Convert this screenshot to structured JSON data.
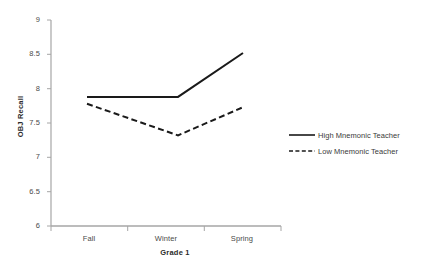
{
  "chart_data": {
    "type": "line",
    "title": "",
    "xlabel": "Grade 1",
    "ylabel": "OBJ Recall",
    "categories": [
      "Fall",
      "Winter",
      "Spring"
    ],
    "ylim": [
      6,
      9
    ],
    "yticks": [
      "6",
      "6.5",
      "7",
      "7.5",
      "8",
      "8.5",
      "9"
    ],
    "ytick_values": [
      6,
      6.5,
      7,
      7.5,
      8,
      8.5,
      9
    ],
    "grid": false,
    "legend_position": "right",
    "series": [
      {
        "name": "High Mnemonic Teacher",
        "style": "solid",
        "color": "#1a1a1a",
        "values": [
          7.88,
          7.88,
          8.52
        ]
      },
      {
        "name": "Low Mnemonic Teacher",
        "style": "dashed",
        "color": "#1a1a1a",
        "values": [
          7.78,
          7.32,
          7.73
        ]
      }
    ]
  },
  "axes": {
    "y_title": "OBJ Recall",
    "x_title": "Grade 1"
  },
  "legend": {
    "items": [
      {
        "label": "High Mnemonic Teacher",
        "swatch": "solid-line-icon"
      },
      {
        "label": "Low Mnemonic Teacher",
        "swatch": "dashed-line-icon"
      }
    ]
  },
  "colors": {
    "axis": "#a6a6a6",
    "series": "#1a1a1a",
    "text": "#3a3a3a",
    "background": "#ffffff"
  }
}
